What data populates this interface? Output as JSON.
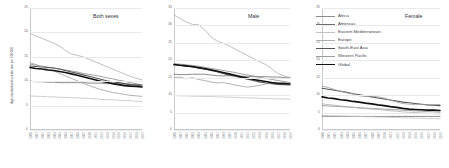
{
  "figure": {
    "ylabel": "Age-standardized suicide rate per 100,000"
  },
  "panels": [
    {
      "key": "both",
      "title": "Both sexes"
    },
    {
      "key": "male",
      "title": "Male"
    },
    {
      "key": "female",
      "title": "Female"
    }
  ],
  "legend": {
    "position": "top-right",
    "entries": [
      {
        "label": "Africa",
        "color": "#8c8c8c",
        "width": 0.8
      },
      {
        "label": "Americas",
        "color": "#6e6e6e",
        "width": 0.8
      },
      {
        "label": "Eastern Mediterranean",
        "color": "#c2c2c2",
        "width": 0.8
      },
      {
        "label": "Europe",
        "color": "#aeaeae",
        "width": 0.8
      },
      {
        "label": "South-East Asia",
        "color": "#555555",
        "width": 1.1
      },
      {
        "label": "Western Pacific",
        "color": "#9e9e9e",
        "width": 0.8
      },
      {
        "label": "Global",
        "color": "#111111",
        "width": 1.6
      }
    ]
  },
  "chart_data": {
    "type": "line",
    "title": "",
    "xlabel": "",
    "ylabel": "Age-standardized suicide rate per 100,000",
    "grid": true,
    "x": [
      2000,
      2001,
      2002,
      2003,
      2004,
      2005,
      2006,
      2007,
      2008,
      2009,
      2010,
      2011,
      2012,
      2013,
      2014,
      2015,
      2016,
      2017,
      2018,
      2019
    ],
    "xtick_labels": [
      "2000",
      "2001",
      "2002",
      "2003",
      "2004",
      "2005",
      "2006",
      "2007",
      "2008",
      "2009",
      "2010",
      "2011",
      "2012",
      "2013",
      "2014",
      "2015",
      "2016",
      "2017",
      "2018",
      "2019"
    ],
    "panels": [
      {
        "name": "Both sexes",
        "ylim": [
          0,
          25
        ],
        "yticks": [
          0,
          5,
          10,
          15,
          20,
          25
        ],
        "series": [
          {
            "name": "Africa",
            "color": "#8c8c8c",
            "values": [
              13.5,
              13.3,
              13.1,
              12.9,
              12.7,
              12.5,
              12.3,
              12.1,
              11.9,
              11.6,
              11.4,
              11.2,
              11.0,
              10.7,
              10.5,
              10.2,
              10.0,
              9.7,
              9.5,
              9.2
            ]
          },
          {
            "name": "Americas",
            "color": "#6e6e6e",
            "values": [
              10.0,
              9.9,
              9.9,
              9.8,
              9.8,
              9.7,
              9.7,
              9.7,
              9.7,
              9.7,
              9.6,
              9.6,
              9.6,
              9.5,
              9.5,
              9.5,
              9.4,
              9.4,
              9.3,
              9.3
            ]
          },
          {
            "name": "Eastern Mediterranean",
            "color": "#c2c2c2",
            "values": [
              7.0,
              6.9,
              6.9,
              6.8,
              6.8,
              6.7,
              6.7,
              6.6,
              6.6,
              6.5,
              6.5,
              6.4,
              6.3,
              6.2,
              6.2,
              6.1,
              6.0,
              6.0,
              5.9,
              5.8
            ]
          },
          {
            "name": "Europe",
            "color": "#aeaeae",
            "values": [
              19.8,
              19.3,
              18.8,
              18.3,
              17.8,
              17.2,
              16.3,
              15.6,
              15.3,
              15.0,
              14.5,
              14.0,
              13.5,
              13.0,
              12.5,
              12.0,
              11.5,
              11.0,
              10.6,
              10.3
            ]
          },
          {
            "name": "South-East Asia",
            "color": "#555555",
            "values": [
              13.1,
              13.0,
              12.9,
              12.8,
              12.7,
              12.5,
              12.2,
              11.9,
              11.6,
              11.3,
              11.0,
              10.7,
              10.4,
              10.1,
              9.9,
              9.7,
              9.5,
              9.3,
              9.2,
              9.0
            ]
          },
          {
            "name": "Western Pacific",
            "color": "#9e9e9e",
            "values": [
              13.8,
              13.4,
              12.9,
              12.5,
              12.1,
              11.6,
              11.1,
              10.6,
              10.1,
              9.6,
              9.1,
              8.7,
              8.3,
              8.0,
              7.7,
              7.5,
              7.3,
              7.1,
              7.0,
              6.9
            ]
          },
          {
            "name": "Global",
            "color": "#111111",
            "values": [
              12.8,
              12.6,
              12.5,
              12.3,
              12.2,
              12.0,
              11.8,
              11.5,
              11.2,
              10.9,
              10.6,
              10.3,
              10.0,
              9.8,
              9.5,
              9.3,
              9.1,
              9.0,
              8.9,
              8.8
            ]
          }
        ]
      },
      {
        "name": "Male",
        "ylim": [
          0,
          35
        ],
        "yticks": [
          0,
          5,
          10,
          15,
          20,
          25,
          30,
          35
        ],
        "series": [
          {
            "name": "Africa",
            "color": "#8c8c8c",
            "values": [
              19.0,
              18.9,
              18.7,
              18.5,
              18.3,
              18.0,
              17.7,
              17.4,
              17.1,
              16.8,
              16.5,
              16.1,
              15.8,
              15.5,
              15.1,
              14.8,
              14.5,
              14.2,
              13.9,
              13.6
            ]
          },
          {
            "name": "Americas",
            "color": "#6e6e6e",
            "values": [
              16.0,
              15.9,
              15.9,
              16.0,
              16.0,
              16.0,
              15.8,
              15.6,
              15.5,
              15.6,
              15.5,
              15.4,
              15.4,
              15.3,
              15.3,
              15.3,
              15.2,
              15.2,
              15.1,
              15.1
            ]
          },
          {
            "name": "Eastern Mediterranean",
            "color": "#c2c2c2",
            "values": [
              9.9,
              9.8,
              9.8,
              9.7,
              9.7,
              9.6,
              9.6,
              9.5,
              9.5,
              9.4,
              9.4,
              9.3,
              9.2,
              9.2,
              9.1,
              9.0,
              9.0,
              8.9,
              8.9,
              8.8
            ]
          },
          {
            "name": "Europe",
            "color": "#aeaeae",
            "values": [
              33.0,
              32.0,
              31.0,
              30.3,
              30.2,
              28.8,
              26.8,
              25.6,
              24.9,
              24.2,
              23.2,
              22.3,
              21.4,
              20.5,
              19.6,
              18.8,
              17.6,
              16.2,
              15.6,
              14.8
            ]
          },
          {
            "name": "South-East Asia",
            "color": "#555555",
            "values": [
              18.7,
              18.5,
              18.3,
              18.1,
              17.8,
              17.5,
              17.1,
              16.7,
              16.2,
              15.8,
              15.4,
              15.0,
              14.6,
              14.2,
              13.8,
              13.5,
              13.3,
              13.1,
              13.0,
              12.9
            ]
          },
          {
            "name": "Western Pacific",
            "color": "#9e9e9e",
            "values": [
              15.0,
              15.2,
              14.7,
              15.0,
              14.5,
              14.2,
              13.8,
              13.5,
              13.6,
              13.3,
              12.9,
              12.6,
              12.3,
              12.5,
              12.8,
              13.2,
              13.4,
              13.6,
              13.6,
              13.5
            ]
          },
          {
            "name": "Global",
            "color": "#111111",
            "values": [
              18.8,
              18.6,
              18.4,
              18.2,
              17.9,
              17.6,
              17.3,
              16.9,
              16.5,
              16.1,
              15.7,
              15.3,
              14.9,
              14.5,
              14.2,
              13.9,
              13.6,
              13.4,
              13.3,
              13.2
            ]
          }
        ]
      },
      {
        "name": "Female",
        "ylim": [
          0,
          35
        ],
        "yticks": [
          0,
          5,
          10,
          15,
          20,
          25,
          30,
          35
        ],
        "series": [
          {
            "name": "Africa",
            "color": "#8c8c8c",
            "values": [
              7.0,
              6.9,
              6.8,
              6.7,
              6.6,
              6.5,
              6.4,
              6.3,
              6.2,
              6.1,
              6.0,
              5.9,
              5.8,
              5.7,
              5.6,
              5.5,
              5.4,
              5.3,
              5.2,
              5.1
            ]
          },
          {
            "name": "Americas",
            "color": "#6e6e6e",
            "values": [
              4.0,
              3.9,
              3.9,
              3.9,
              3.9,
              3.9,
              3.9,
              3.9,
              3.9,
              3.9,
              3.9,
              3.9,
              3.9,
              3.9,
              3.9,
              3.9,
              3.9,
              3.9,
              3.9,
              3.9
            ]
          },
          {
            "name": "Eastern Mediterranean",
            "color": "#c2c2c2",
            "values": [
              4.2,
              4.1,
              4.1,
              4.0,
              4.0,
              3.9,
              3.9,
              3.8,
              3.8,
              3.7,
              3.7,
              3.6,
              3.6,
              3.5,
              3.5,
              3.4,
              3.4,
              3.3,
              3.3,
              3.2
            ]
          },
          {
            "name": "Europe",
            "color": "#aeaeae",
            "values": [
              7.5,
              7.3,
              7.1,
              6.9,
              6.7,
              6.5,
              6.3,
              6.1,
              6.0,
              5.9,
              5.7,
              5.5,
              5.4,
              5.2,
              5.1,
              5.0,
              4.9,
              4.8,
              4.7,
              4.6
            ]
          },
          {
            "name": "South-East Asia",
            "color": "#555555",
            "values": [
              12.0,
              11.7,
              11.4,
              11.1,
              10.8,
              10.4,
              10.1,
              9.8,
              9.5,
              9.2,
              8.9,
              8.6,
              8.3,
              8.0,
              7.8,
              7.6,
              7.4,
              7.2,
              7.1,
              7.0
            ]
          },
          {
            "name": "Western Pacific",
            "color": "#9e9e9e",
            "values": [
              12.6,
              12.2,
              11.6,
              11.1,
              10.7,
              10.3,
              9.8,
              9.6,
              9.7,
              9.5,
              9.2,
              8.6,
              8.0,
              7.6,
              7.4,
              7.3,
              7.3,
              7.3,
              7.3,
              7.3
            ]
          },
          {
            "name": "Global",
            "color": "#111111",
            "values": [
              9.5,
              9.2,
              9.0,
              8.7,
              8.5,
              8.2,
              8.0,
              7.7,
              7.5,
              7.2,
              7.0,
              6.7,
              6.5,
              6.2,
              6.0,
              5.9,
              5.8,
              5.7,
              5.7,
              5.6
            ]
          }
        ]
      }
    ]
  }
}
